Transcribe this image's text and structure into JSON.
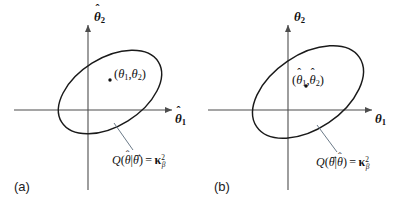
{
  "figure": {
    "background_color": "#ffffff",
    "axis_color": "#4d4d4d",
    "curve_color": "#1a1a1a",
    "leader_color": "#5a6b7a",
    "text_color": "#111111"
  },
  "panels": [
    {
      "tag": "(a)",
      "x_axis_label": "θ̂₁",
      "y_axis_label": "θ̂₂",
      "point_label": "(θ₁,θ₂)",
      "formula": "Q(θ̂|θ⃗) = κ²β",
      "parts": {
        "q": "Q",
        "open_paren": "(",
        "arg1_base": "θ",
        "arg1_accent": "ˆ",
        "arg1_sub": "",
        "bar": "|",
        "arg2_base": "θ",
        "arg2_accent": "→",
        "close_paren": ")",
        "equals": "=",
        "kappa": "κ",
        "kappa_sup": "2",
        "kappa_sub": "β"
      },
      "point_parts": {
        "open_paren": "(",
        "t1_base": "θ",
        "t1_accent": "",
        "t1_sub": "1",
        "comma": ",",
        "t2_base": "θ",
        "t2_accent": "",
        "t2_sub": "2",
        "close_paren": ")"
      },
      "x_axis_parts": {
        "base": "θ",
        "accent": "ˆ",
        "sub": "1"
      },
      "y_axis_parts": {
        "base": "θ",
        "accent": "ˆ",
        "sub": "2"
      }
    },
    {
      "tag": "(b)",
      "x_axis_label": "θ₁",
      "y_axis_label": "θ₂",
      "point_label": "(θ̂₁,θ̂₂)",
      "formula": "Q(θ⃗|θ̂) = κ²β",
      "parts": {
        "q": "Q",
        "open_paren": "(",
        "arg1_base": "θ",
        "arg1_accent": "→",
        "arg1_sub": "",
        "bar": "|",
        "arg2_base": "θ",
        "arg2_accent": "ˆ",
        "close_paren": ")",
        "equals": "=",
        "kappa": "κ",
        "kappa_sup": "2",
        "kappa_sub": "β"
      },
      "point_parts": {
        "open_paren": "(",
        "t1_base": "θ",
        "t1_accent": "ˆ",
        "t1_sub": "1",
        "comma": ",",
        "t2_base": "θ",
        "t2_accent": "ˆ",
        "t2_sub": "2",
        "close_paren": ")"
      },
      "x_axis_parts": {
        "base": "θ",
        "accent": "",
        "sub": "1"
      },
      "y_axis_parts": {
        "base": "θ",
        "accent": "",
        "sub": "2"
      }
    }
  ]
}
